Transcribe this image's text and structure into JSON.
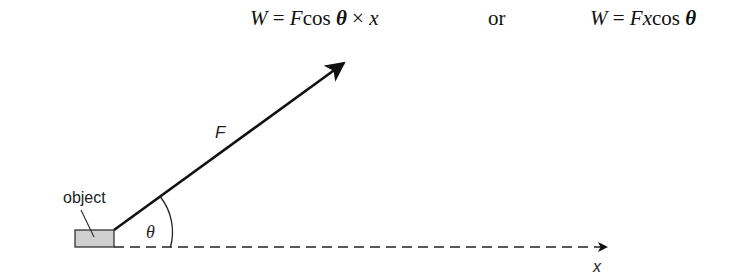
{
  "formulas": {
    "first": {
      "W": "W",
      "eq": " = ",
      "F": "F",
      "cos": "cos ",
      "theta": "θ",
      "times": " × ",
      "x": "x"
    },
    "connector": "or",
    "second": {
      "W": "W",
      "eq": " = ",
      "F": "F",
      "x": "x",
      "cos": "cos ",
      "theta": "θ"
    }
  },
  "diagram": {
    "object_label": "object",
    "force_label": "F",
    "angle_label": "θ",
    "displacement_label": "x",
    "colors": {
      "line": "#111111",
      "object_fill": "#cfcfcf",
      "object_stroke": "#333333"
    }
  }
}
